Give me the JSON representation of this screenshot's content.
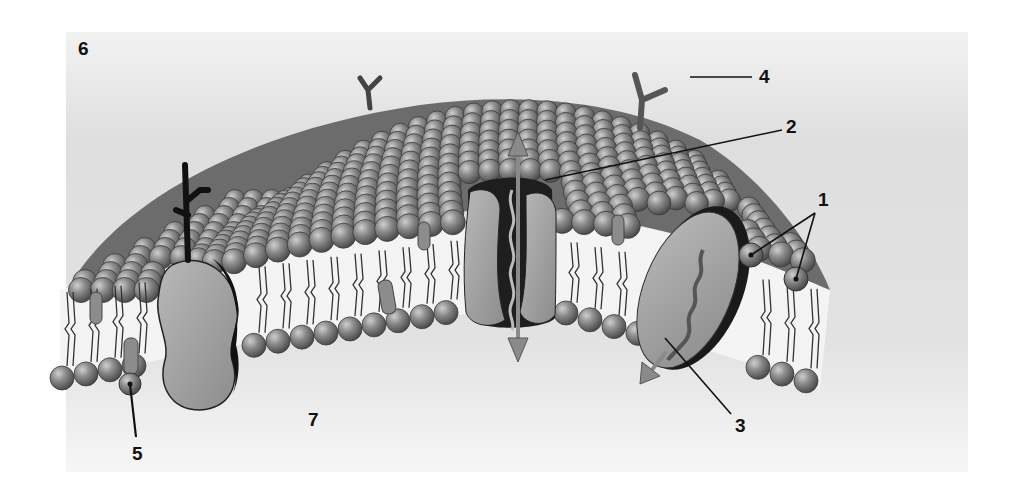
{
  "diagram": {
    "type": "cell-membrane-fluid-mosaic",
    "colors": {
      "background_panel": "#dcdcdc",
      "head": "#7a7a7a",
      "head_highlight": "#c8c8c8",
      "protein": "#9a9a9a",
      "protein_dark": "#1a1a1a",
      "arrow": "#8a8a8a",
      "leader_line": "#111111"
    },
    "labels": [
      {
        "id": "1",
        "text": "1",
        "x": 818,
        "y": 190
      },
      {
        "id": "2",
        "text": "2",
        "x": 786,
        "y": 117
      },
      {
        "id": "3",
        "text": "3",
        "x": 735,
        "y": 416
      },
      {
        "id": "4",
        "text": "4",
        "x": 759,
        "y": 67
      },
      {
        "id": "5",
        "text": "5",
        "x": 132,
        "y": 444
      },
      {
        "id": "6",
        "text": "6",
        "x": 78,
        "y": 39
      },
      {
        "id": "7",
        "text": "7",
        "x": 308,
        "y": 410
      }
    ]
  }
}
